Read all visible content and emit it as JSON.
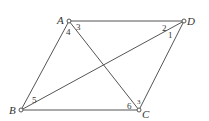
{
  "diagram": {
    "points": {
      "A": {
        "label": "A",
        "x": 69,
        "y": 21
      },
      "D": {
        "label": "D",
        "x": 184,
        "y": 21
      },
      "B": {
        "label": "B",
        "x": 21,
        "y": 110
      },
      "C": {
        "label": "C",
        "x": 139,
        "y": 110
      }
    },
    "segments": [
      "AD",
      "AB",
      "AC",
      "BC",
      "BD",
      "CD"
    ],
    "angle_labels": {
      "a1": "1",
      "a2": "2",
      "a3": "3",
      "a4": "4",
      "a5": "5",
      "a6": "6",
      "a7": "3"
    },
    "line_color": "#555555"
  }
}
